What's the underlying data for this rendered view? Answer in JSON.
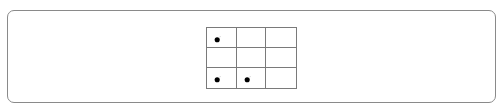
{
  "board": {
    "rows": 3,
    "cols": 3,
    "cells": [
      [
        {
          "bomb": true
        },
        {
          "bomb": false
        },
        {
          "bomb": false
        }
      ],
      [
        {
          "bomb": false
        },
        {
          "bomb": false
        },
        {
          "bomb": false
        }
      ],
      [
        {
          "bomb": true
        },
        {
          "bomb": true
        },
        {
          "bomb": false
        }
      ]
    ]
  },
  "colors": {
    "border": "#7a7a7a",
    "bomb": "#000000",
    "background": "#ffffff"
  }
}
